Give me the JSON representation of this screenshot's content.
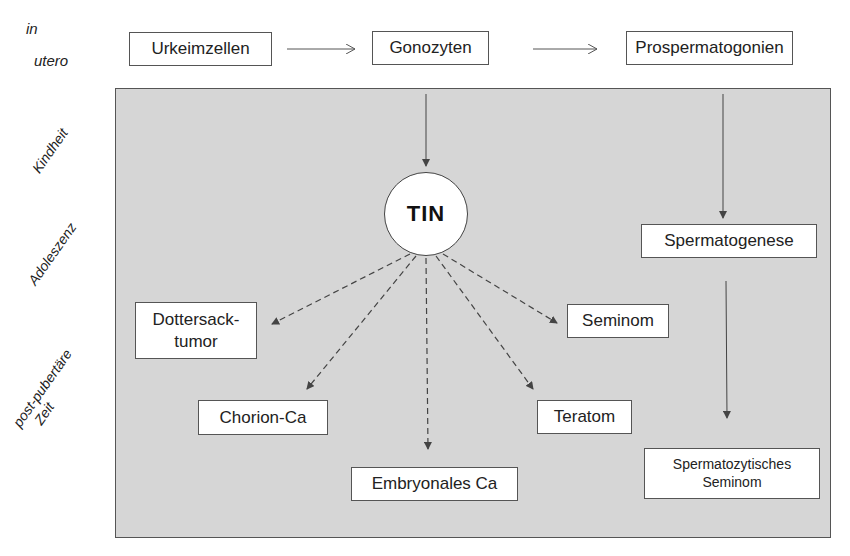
{
  "time_labels": {
    "in_utero_line1": "in",
    "in_utero_line2": "utero",
    "kindheit": "Kindheit",
    "adoleszenz": "Adoleszenz",
    "post_pubertaer_line1": "post-pubertäre",
    "post_pubertaer_line2": "Zeit"
  },
  "nodes": {
    "urkeimzellen": "Urkeimzellen",
    "gonozyten": "Gonozyten",
    "prospermatogonien": "Prospermatogonien",
    "tin": "TIN",
    "spermatogenese": "Spermatogenese",
    "dottersack_line1": "Dottersack-",
    "dottersack_line2": "tumor",
    "seminom": "Seminom",
    "chorion_ca": "Chorion-Ca",
    "teratom": "Teratom",
    "embryonales_ca": "Embryonales Ca",
    "spermatozytisches_line1": "Spermatozytisches",
    "spermatozytisches_line2": "Seminom"
  },
  "colors": {
    "panel_bg": "#d6d6d6",
    "box_bg": "#ffffff",
    "stroke": "#555555"
  }
}
